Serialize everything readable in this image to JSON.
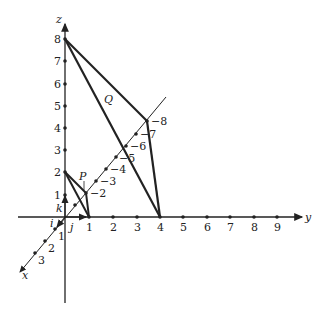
{
  "diagram": {
    "type": "3d-coordinate-axes",
    "axes": {
      "x_label": "x",
      "y_label": "y",
      "z_label": "z"
    },
    "unit_vectors": {
      "i": "i",
      "j": "j",
      "k": "k"
    },
    "z_ticks": [
      "1",
      "2",
      "3",
      "4",
      "5",
      "6",
      "7",
      "8"
    ],
    "y_ticks": [
      "1",
      "2",
      "3",
      "4",
      "5",
      "6",
      "7",
      "8",
      "9"
    ],
    "x_pos_ticks": [
      "1",
      "2",
      "3"
    ],
    "x_neg_ticks": [
      "−2",
      "−3",
      "−4",
      "−5",
      "−6",
      "−7",
      "−8"
    ],
    "regions": {
      "P": {
        "label": "P",
        "vertices": [
          "(0,0,2)",
          "(-2,0,0)",
          "(0,1,0)"
        ]
      },
      "Q": {
        "label": "Q",
        "vertices": [
          "(0,0,8)",
          "(-8,0,0)",
          "(0,4,0)"
        ]
      }
    },
    "colors": {
      "line": "#222222",
      "background": "#ffffff"
    }
  }
}
